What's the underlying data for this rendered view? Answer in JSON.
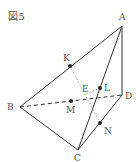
{
  "figure": {
    "title": "図5",
    "colors": {
      "line": "#333333",
      "dotted": "#999999",
      "label": "#555555"
    },
    "vertices": {
      "A": {
        "label": "A",
        "x": 122,
        "y": 26
      },
      "B": {
        "label": "B",
        "x": 20,
        "y": 107
      },
      "C": {
        "label": "C",
        "x": 78,
        "y": 150
      },
      "D": {
        "label": "D",
        "x": 122,
        "y": 95
      }
    },
    "points": {
      "K": {
        "label": "K",
        "x": 70,
        "y": 66
      },
      "L": {
        "label": "L",
        "x": 100,
        "y": 88
      },
      "M": {
        "label": "M",
        "x": 71,
        "y": 101
      },
      "N": {
        "label": "N",
        "x": 100,
        "y": 123
      },
      "E": {
        "label": "E",
        "x": 86,
        "y": 91
      }
    },
    "edges": {
      "solid": [
        "AB",
        "AC",
        "AD",
        "BC",
        "CD"
      ],
      "dashed": [
        "BD"
      ],
      "dotted": [
        "KN",
        "EL"
      ]
    }
  }
}
